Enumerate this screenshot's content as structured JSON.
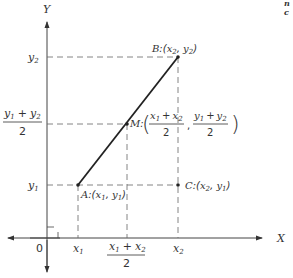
{
  "diagram": {
    "axes": {
      "x_label": "X",
      "y_label": "Y",
      "origin_label": "0"
    },
    "points": {
      "A": {
        "label": "A",
        "coords": "(x1, y1)"
      },
      "B": {
        "label": "B",
        "coords": "(x2, y2)"
      },
      "C": {
        "label": "C",
        "coords": "(x2, y1)"
      },
      "M": {
        "label": "M",
        "coords": "((x1+x2)/2, (y1+y2)/2)"
      }
    },
    "x_ticks": [
      "x1",
      "(x1 + x2)/2",
      "x2"
    ],
    "y_ticks": [
      "y1",
      "(y1 + y2)/2",
      "y2"
    ],
    "corner_fragments": [
      "n",
      "c"
    ]
  },
  "text": {
    "Y": "Y",
    "X": "X",
    "zero": "0",
    "y2": "y",
    "y2_sub": "2",
    "y1": "y",
    "y1_sub": "1",
    "x1": "x",
    "x1_sub": "1",
    "x2": "x",
    "x2_sub": "2",
    "two": "2",
    "plus": "+",
    "A": "A",
    "B": "B",
    "C": "C",
    "M": "M",
    "frag1": "n",
    "frag2": "c"
  }
}
